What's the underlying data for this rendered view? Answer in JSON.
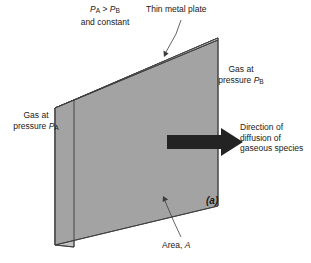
{
  "figure": {
    "id": "(a)",
    "caption_letter": "(a)",
    "type": "gas-diffusion-through-metal-plate-diagram"
  },
  "labels": {
    "pressure_relation": {
      "line1_prefix": "P",
      "line1_sub_a": "A",
      "line1_mid": " > ",
      "line1_prefix2": "P",
      "line1_sub_b": "B",
      "line2": "and constant",
      "full_text": "PA > PB and constant"
    },
    "thin_metal_plate": "Thin metal plate",
    "gas_b": {
      "line1": "Gas at",
      "line2_prefix": "pressure ",
      "line2_symbol": "P",
      "line2_sub": "B",
      "full_text": "Gas at pressure PB"
    },
    "gas_a": {
      "line1": "Gas at",
      "line2_prefix": "pressure ",
      "line2_symbol": "P",
      "line2_sub": "A",
      "full_text": "Gas at pressure PA"
    },
    "direction": {
      "line1": "Direction of",
      "line2": "diffusion of",
      "line3": "gaseous species",
      "full_text": "Direction of diffusion of gaseous species"
    },
    "area": {
      "prefix": "Area, ",
      "symbol": "A",
      "full_text": "Area, A"
    }
  },
  "colors": {
    "top_face": "#c9c9c9",
    "front_face": "#a3a3a3",
    "left_face": "#c2c2c2",
    "outline": "#3c3c3c",
    "arrow": "#232323",
    "leader_line": "#3c3c3c",
    "text": "#1a1a1a",
    "background": "#ffffff"
  },
  "geometry": {
    "box": {
      "front_top_left": [
        55,
        108
      ],
      "front_top_right": [
        218,
        40
      ],
      "front_bottom_right": [
        218,
        206
      ],
      "front_bottom_left": [
        55,
        245
      ],
      "back_top_left": [
        74,
        100
      ],
      "back_top_right": [
        218,
        38
      ],
      "left_face_top_back": [
        74,
        100
      ],
      "left_face_bottom": [
        74,
        247
      ]
    },
    "arrow": {
      "tail_x": 167,
      "tip_x": 243,
      "center_y": 142,
      "shaft_half_height": 7,
      "head_half_height": 14,
      "head_length": 22
    },
    "leaders": [
      {
        "name": "thin-metal-plate-leader",
        "from": [
          181,
          20
        ],
        "to": [
          163,
          56
        ]
      },
      {
        "name": "area-leader",
        "from": [
          181,
          238
        ],
        "to": [
          163,
          196
        ]
      }
    ]
  }
}
